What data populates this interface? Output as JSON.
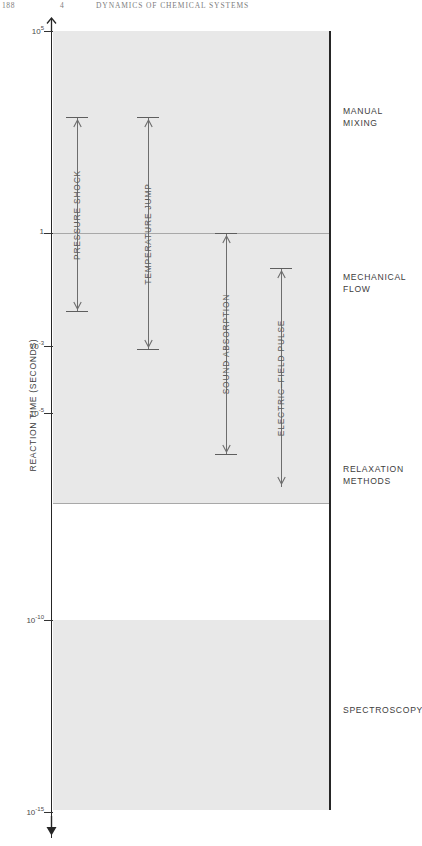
{
  "running_head": {
    "folio": "188",
    "chapter": "4",
    "title": "DYNAMICS OF CHEMICAL SYSTEMS"
  },
  "axis": {
    "y_title": "REACTION TIME (SECONDS)",
    "ticks": [
      {
        "label": "10",
        "exp": "5",
        "y": 31
      },
      {
        "label": "1",
        "exp": "",
        "y": 233
      },
      {
        "label": "10",
        "exp": "-3",
        "y": 346
      },
      {
        "label": "10",
        "exp": "-5",
        "y": 413
      },
      {
        "label": "10",
        "exp": "-10",
        "y": 620
      },
      {
        "label": "10",
        "exp": "-15",
        "y": 812
      }
    ],
    "arrow_up_name": "axis-arrow-up",
    "arrow_down_name": "axis-arrow-down"
  },
  "methods": [
    {
      "label": "PRESSURE SHOCK",
      "x": 77,
      "top": 117,
      "bottom": 312,
      "cap_top": true,
      "cap_bottom": true,
      "head": "down"
    },
    {
      "label": "TEMPERATURE JUMP",
      "x": 148,
      "top": 117,
      "bottom": 350,
      "cap_top": true,
      "cap_bottom": true,
      "head": "down"
    },
    {
      "label": "SOUND ABSORPTION",
      "x": 226,
      "top": 233,
      "bottom": 455,
      "cap_top": true,
      "cap_bottom": true,
      "head": "up"
    },
    {
      "label": "ELECTRIC–FIELD PULSE",
      "x": 281,
      "top": 268,
      "bottom": 487,
      "cap_top": true,
      "cap_bottom": false,
      "head": "up"
    }
  ],
  "categories": [
    {
      "lines": [
        "MANUAL",
        "MIXING"
      ],
      "y": 106
    },
    {
      "lines": [
        "MECHANICAL",
        "FLOW"
      ],
      "y": 272
    },
    {
      "lines": [
        "RELAXATION",
        "METHODS"
      ],
      "y": 464
    },
    {
      "lines": [
        "SPECTROSCOPY"
      ],
      "y": 705
    }
  ],
  "separators": [
    233,
    503
  ],
  "colors": {
    "band": "#e8e8e8",
    "axis": "#262626",
    "arrow": "#6d6d6d",
    "text": "#3d3d3d"
  },
  "chart_data": {
    "type": "bar",
    "ylabel": "REACTION TIME (SECONDS)",
    "xlabel": "",
    "scale": "log10",
    "ylim": [
      1e-15,
      100000.0
    ],
    "ytick_values": [
      100000.0,
      1,
      0.001,
      1e-05,
      1e-10,
      1e-15
    ],
    "ytick_labels": [
      "10^5",
      "1",
      "10^-3",
      "10^-5",
      "10^-10",
      "10^-15"
    ],
    "axis_inverted": true,
    "grid": false,
    "legend": "none",
    "categories": [
      "PRESSURE SHOCK",
      "TEMPERATURE JUMP",
      "SOUND ABSORPTION",
      "ELECTRIC-FIELD PULSE"
    ],
    "series": [
      {
        "name": "range_upper_log10_seconds",
        "values": [
          3.8,
          3.8,
          0.0,
          -1.8
        ]
      },
      {
        "name": "range_lower_log10_seconds",
        "values": [
          -1.8,
          -3.0,
          -6.9,
          -7.6
        ]
      }
    ],
    "annotations": [
      "MANUAL MIXING",
      "MECHANICAL FLOW",
      "RELAXATION METHODS",
      "SPECTROSCOPY"
    ],
    "shaded_bands_log10": [
      [
        5.0,
        -7.9
      ],
      [
        -10.0,
        -15.0
      ]
    ]
  }
}
